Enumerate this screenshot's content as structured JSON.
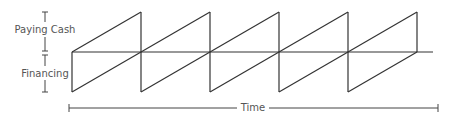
{
  "diagram": {
    "labels": {
      "upper": "Paying Cash",
      "lower": "Financing",
      "time": "Time"
    },
    "colors": {
      "line": "#333333",
      "text": "#555555",
      "background": "#ffffff"
    },
    "sawtooth": {
      "teeth": 5,
      "start_x": 72,
      "period": 69,
      "top_y": 12,
      "mid_y": 52,
      "bottom_y": 92,
      "axis_end_x": 433
    },
    "time_axis": {
      "x_start": 69,
      "x_end": 438,
      "y": 108
    }
  }
}
